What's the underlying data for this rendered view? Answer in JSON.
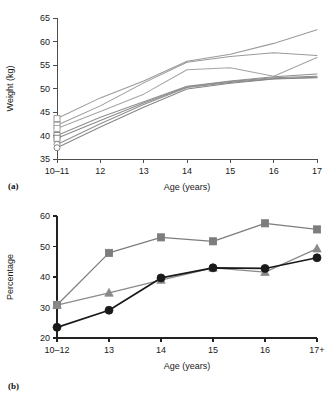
{
  "figure": {
    "panel_a_label": "(a)",
    "panel_b_label": "(b)"
  },
  "chart_data": [
    {
      "panel": "(a)",
      "type": "line",
      "title": "",
      "xlabel": "Age (years)",
      "ylabel": "Weight (kg)",
      "categories": [
        "10–11",
        "12",
        "13",
        "14",
        "15",
        "16",
        "17"
      ],
      "xtick_labels": [
        "10–11",
        "12",
        "13",
        "14",
        "15",
        "16",
        "17"
      ],
      "ytick_labels": [
        "35",
        "40",
        "45",
        "50",
        "55",
        "60",
        "65"
      ],
      "xlim": [
        0,
        6
      ],
      "ylim": [
        35,
        65
      ],
      "grid": false,
      "legend": "none",
      "markers": "open squares and circles at first point only",
      "series": [
        {
          "name": "cohort-1",
          "color": "#9a9a9a",
          "start_marker": "square",
          "values": [
            43.6,
            48.0,
            51.6,
            55.8,
            57.3,
            59.6,
            62.5
          ]
        },
        {
          "name": "cohort-2",
          "color": "#9a9a9a",
          "start_marker": "square",
          "values": [
            42.2,
            46.3,
            51.2,
            55.6,
            56.8,
            57.6,
            57.0
          ]
        },
        {
          "name": "cohort-3",
          "color": "#a5a5a5",
          "start_marker": "square",
          "values": [
            41.5,
            45.1,
            48.8,
            54.0,
            54.4,
            52.6,
            56.6
          ]
        },
        {
          "name": "cohort-4",
          "color": "#8f8f8f",
          "start_marker": "square",
          "values": [
            40.0,
            43.9,
            47.2,
            50.5,
            51.6,
            52.5,
            53.1
          ]
        },
        {
          "name": "cohort-5",
          "color": "#8a8a8a",
          "start_marker": "square",
          "values": [
            39.4,
            43.2,
            46.9,
            50.3,
            51.5,
            52.3,
            52.6
          ]
        },
        {
          "name": "cohort-6",
          "color": "#8f8f8f",
          "start_marker": "circle",
          "values": [
            38.1,
            42.5,
            46.6,
            50.2,
            51.3,
            52.1,
            52.4
          ]
        },
        {
          "name": "cohort-7",
          "color": "#868686",
          "start_marker": "circle",
          "values": [
            37.4,
            41.8,
            46.0,
            49.9,
            51.1,
            52.0,
            52.3
          ]
        }
      ]
    },
    {
      "panel": "(b)",
      "type": "line",
      "title": "",
      "xlabel": "Age (years)",
      "ylabel": "Percentage",
      "categories": [
        "10–12",
        "13",
        "14",
        "15",
        "16",
        "17+"
      ],
      "xtick_labels": [
        "10–12",
        "13",
        "14",
        "15",
        "16",
        "17+"
      ],
      "ytick_labels": [
        "20",
        "30",
        "40",
        "50",
        "60"
      ],
      "xlim": [
        0,
        5
      ],
      "ylim": [
        20,
        60
      ],
      "grid": false,
      "legend": "none",
      "series": [
        {
          "name": "series-square",
          "marker": "square",
          "color": "#7d7d7d",
          "values": [
            30.8,
            47.9,
            53.0,
            51.7,
            57.6,
            55.6
          ]
        },
        {
          "name": "series-triangle",
          "marker": "triangle",
          "color": "#8a8a8a",
          "values": [
            30.8,
            34.8,
            39.0,
            43.0,
            41.6,
            49.3
          ]
        },
        {
          "name": "series-circle",
          "marker": "circle",
          "color": "#1a1a1a",
          "values": [
            23.5,
            29.1,
            39.7,
            43.0,
            42.8,
            46.3
          ]
        }
      ]
    }
  ]
}
